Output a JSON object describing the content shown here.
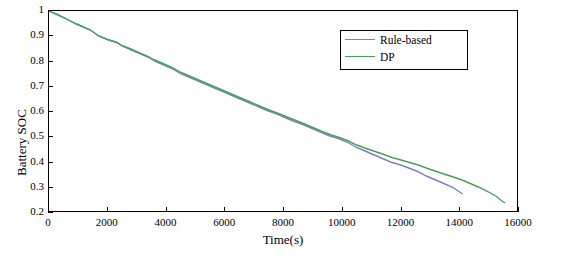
{
  "chart_data": {
    "type": "line",
    "title": "",
    "xlabel": "Time(s)",
    "ylabel": "Battery SOC",
    "xlim": [
      0,
      16000
    ],
    "ylim": [
      0.2,
      1.0
    ],
    "xticks": [
      0,
      2000,
      4000,
      6000,
      8000,
      10000,
      12000,
      14000,
      16000
    ],
    "xtick_labels": [
      "0",
      "2000",
      "4000",
      "6000",
      "8000",
      "10000",
      "12000",
      "14000",
      "16000"
    ],
    "yticks": [
      0.2,
      0.3,
      0.4,
      0.5,
      0.6,
      0.7,
      0.8,
      0.9,
      1.0
    ],
    "ytick_labels": [
      "0.2",
      "0.3",
      "0.4",
      "0.5",
      "0.6",
      "0.7",
      "0.8",
      "0.9",
      "1"
    ],
    "grid": false,
    "legend_position": "top-right",
    "series": [
      {
        "name": "Rule-based",
        "color": "#7b7fc4",
        "x": [
          0,
          300,
          600,
          900,
          1100,
          1400,
          1700,
          2000,
          2300,
          2500,
          2800,
          3100,
          3400,
          3600,
          3900,
          4200,
          4500,
          4800,
          5100,
          5400,
          5700,
          6000,
          6300,
          6600,
          6900,
          7200,
          7500,
          7800,
          8100,
          8400,
          8700,
          9000,
          9300,
          9600,
          9900,
          10200,
          10500,
          10800,
          11100,
          11400,
          11700,
          12000,
          12300,
          12600,
          12900,
          13200,
          13500,
          13800,
          14050,
          14150
        ],
        "y": [
          1.0,
          0.985,
          0.968,
          0.95,
          0.94,
          0.925,
          0.9,
          0.886,
          0.875,
          0.86,
          0.845,
          0.83,
          0.815,
          0.8,
          0.785,
          0.77,
          0.75,
          0.735,
          0.72,
          0.705,
          0.69,
          0.675,
          0.66,
          0.645,
          0.63,
          0.615,
          0.6,
          0.588,
          0.572,
          0.558,
          0.545,
          0.53,
          0.515,
          0.5,
          0.49,
          0.475,
          0.455,
          0.44,
          0.425,
          0.41,
          0.395,
          0.385,
          0.372,
          0.358,
          0.34,
          0.325,
          0.31,
          0.295,
          0.275,
          0.268
        ]
      },
      {
        "name": "DP",
        "color": "#4aa05a",
        "x": [
          0,
          300,
          600,
          900,
          1100,
          1400,
          1700,
          2000,
          2300,
          2500,
          2800,
          3100,
          3400,
          3600,
          3900,
          4200,
          4500,
          4800,
          5100,
          5400,
          5700,
          6000,
          6300,
          6600,
          6900,
          7200,
          7500,
          7800,
          8100,
          8400,
          8700,
          9000,
          9300,
          9600,
          9900,
          10200,
          10500,
          10800,
          11100,
          11400,
          11700,
          12000,
          12300,
          12600,
          12900,
          13200,
          13500,
          13800,
          14100,
          14400,
          14700,
          15000,
          15300,
          15500,
          15600
        ],
        "y": [
          1.0,
          0.985,
          0.968,
          0.95,
          0.94,
          0.925,
          0.9,
          0.886,
          0.875,
          0.862,
          0.848,
          0.832,
          0.818,
          0.805,
          0.79,
          0.775,
          0.755,
          0.74,
          0.725,
          0.71,
          0.695,
          0.68,
          0.665,
          0.65,
          0.635,
          0.62,
          0.605,
          0.592,
          0.578,
          0.564,
          0.55,
          0.535,
          0.52,
          0.506,
          0.495,
          0.482,
          0.465,
          0.452,
          0.44,
          0.428,
          0.415,
          0.405,
          0.395,
          0.385,
          0.372,
          0.36,
          0.348,
          0.337,
          0.325,
          0.31,
          0.295,
          0.278,
          0.258,
          0.238,
          0.232
        ]
      }
    ],
    "legend": [
      {
        "label": "Rule-based",
        "color": "#7b7fc4"
      },
      {
        "label": "DP",
        "color": "#4aa05a"
      }
    ]
  }
}
